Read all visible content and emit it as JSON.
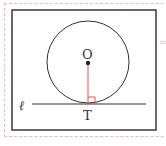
{
  "figure": {
    "labels": {
      "center": "O",
      "tangent_point": "T",
      "line": "ℓ"
    },
    "colors": {
      "circle": "#333333",
      "radius": "#e05050",
      "right_angle": "#e05050",
      "frame": "#333333",
      "outer_border": "#f2b8b8"
    },
    "geometry": {
      "center": [
        88,
        62
      ],
      "radius": 41,
      "line_y": 104,
      "line_x": [
        32,
        146
      ]
    }
  }
}
